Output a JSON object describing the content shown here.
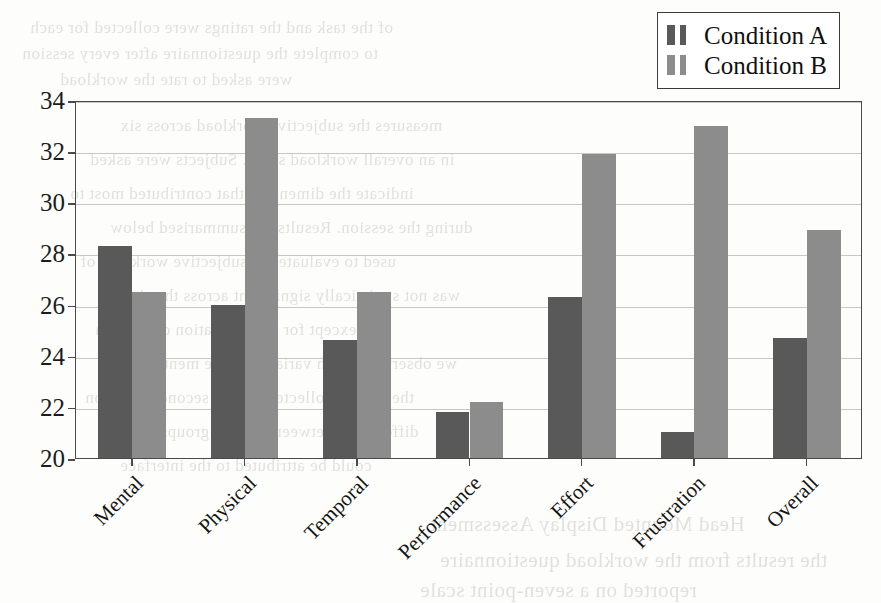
{
  "chart_data": {
    "type": "bar",
    "title": "",
    "xlabel": "",
    "ylabel": "",
    "ylim": [
      20,
      34
    ],
    "yticks": [
      20,
      22,
      24,
      26,
      28,
      30,
      32,
      34
    ],
    "grid": true,
    "legend_position": "top-right",
    "categories": [
      "Mental",
      "Physical",
      "Temporal",
      "Performance",
      "Effort",
      "Frustration",
      "Overall"
    ],
    "series": [
      {
        "name": "Condition A",
        "color": "#595959",
        "values": [
          28.3,
          26.0,
          24.6,
          21.8,
          26.3,
          21.0,
          24.7
        ]
      },
      {
        "name": "Condition B",
        "color": "#8c8c8c",
        "values": [
          26.5,
          33.3,
          26.5,
          22.2,
          31.9,
          33.0,
          28.9
        ]
      }
    ]
  },
  "legend": {
    "entries": [
      {
        "label": "Condition A",
        "color": "#595959"
      },
      {
        "label": "Condition B",
        "color": "#8c8c8c"
      }
    ]
  },
  "axis": {
    "y_tick_labels": [
      "34",
      "32",
      "30",
      "28",
      "26",
      "24",
      "22",
      "20"
    ]
  },
  "page_background": {
    "note": "faint scanned bleed-through text from reverse of page",
    "lines_top": [
      "of the task and the ratings were collected for each",
      "to complete the questionnaire after every session",
      "were asked to rate the workload"
    ],
    "lines_body": [
      "measures the subjective workload across six",
      "in an overall workload score. Subjects were asked",
      "indicate the dimension that contributed most to",
      "during the session. Results are summarised below",
      "used to evaluate the subjective workload of",
      "was not statistically significant across the six",
      "except for the frustration dimension",
      "we observed a high variance in the mental",
      "the ratings collected for the second condition",
      "differences between the two groups",
      "could be attributed to the interface"
    ],
    "lines_bottom": [
      "Head Mounted Display Assessment",
      "the results from the workload questionnaire",
      "reported on a seven-point scale"
    ]
  }
}
